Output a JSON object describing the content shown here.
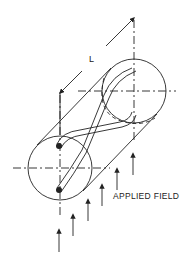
{
  "diagram": {
    "type": "technical-illustration",
    "labels": {
      "dimension": "L",
      "field": "APPLIED FIELD"
    },
    "components": [
      {
        "name": "cylinder-front-face",
        "kind": "circle"
      },
      {
        "name": "cylinder-back-face",
        "kind": "circle"
      },
      {
        "name": "twisted-wire-pair",
        "kind": "conductor"
      },
      {
        "name": "length-dimension",
        "kind": "dimension-line",
        "label": "L"
      },
      {
        "name": "field-arrows",
        "kind": "arrow-set",
        "count": 6,
        "direction": "up"
      }
    ],
    "colors": {
      "line": "#222222",
      "background": "#ffffff"
    }
  }
}
